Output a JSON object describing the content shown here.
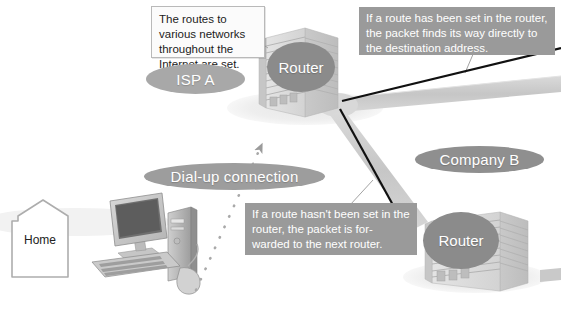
{
  "diagram": {
    "background_color": "#ffffff"
  },
  "callouts": [
    {
      "id": "isp-routes-note",
      "style": "white",
      "text": "The routes to various networks throughout the Internet are set."
    },
    {
      "id": "route-set-note",
      "style": "gray",
      "text": "If a route has been set in the router, the packet finds its way directly to the destination address."
    },
    {
      "id": "route-not-set-note",
      "style": "gray",
      "text": "If a route hasn't been set in the router, the packet is for-warded to the next router."
    }
  ],
  "labels": {
    "isp": "ISP A",
    "dialup": "Dial-up connection",
    "company": "Company B",
    "home": "Home",
    "router_isp": "Router",
    "router_company": "Router"
  },
  "nodes": [
    {
      "id": "home",
      "label": "Home",
      "kind": "house-outline"
    },
    {
      "id": "computer",
      "label": "",
      "kind": "desktop-computer"
    },
    {
      "id": "isp-building",
      "label": "Router",
      "kind": "office-building"
    },
    {
      "id": "company-building",
      "label": "Router",
      "kind": "office-building"
    }
  ],
  "connections": [
    {
      "id": "dialup-link",
      "from": "computer",
      "to": "isp-building",
      "style": "dotted-arrow",
      "label": "Dial-up connection"
    },
    {
      "id": "internet-link",
      "from": "isp-building",
      "to": "internet",
      "style": "solid-arrow-right",
      "color": "#111111"
    },
    {
      "id": "forward-link",
      "from": "isp-building",
      "to": "company-building",
      "style": "solid-arrow-down",
      "color": "#111111"
    }
  ],
  "colors": {
    "callout_gray_bg": "#9a9a9a",
    "callout_white_bg": "#fbfbfb",
    "callout_border": "#b9b9b9",
    "pill_gray": "#9d9d9d",
    "badge_gray": "#8b8b8b",
    "arrow_black": "#111111",
    "pipe_gray": "#cfcfcf",
    "leader_gray": "#9e9e9e"
  }
}
